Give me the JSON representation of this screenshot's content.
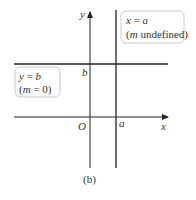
{
  "figure": {
    "caption": "(b)",
    "axes": {
      "x_label": "x",
      "y_label": "y",
      "origin_label": "O"
    },
    "lines": [
      {
        "id": "horizontal",
        "equation_lhs": "y",
        "equation_rhs": "b",
        "slope_note_pre": "(",
        "slope_var": "m",
        "slope_note_post": " = 0)",
        "intercept_label": "b"
      },
      {
        "id": "vertical",
        "equation_lhs": "x",
        "equation_rhs": "a",
        "slope_note_pre": "(",
        "slope_var": "m",
        "slope_note_post": " undefined)",
        "intercept_label": "a"
      }
    ],
    "colors": {
      "line": "#222222",
      "box_border": "#c8c8c8",
      "text": "#333333"
    }
  }
}
